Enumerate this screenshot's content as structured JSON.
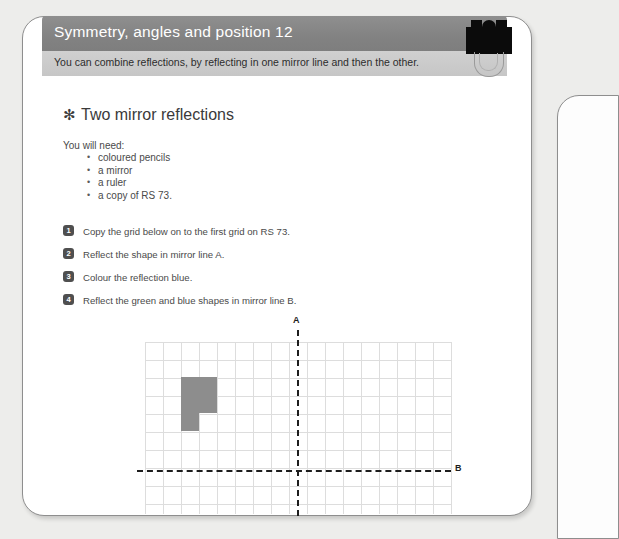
{
  "page": {
    "header": {
      "title": "Symmetry, angles and position 12",
      "subtitle": "You can combine reflections, by reflecting in one mirror line and then the other.",
      "title_bar_color": "#8a8a8a",
      "subtitle_bar_color": "#cacaca",
      "title_text_color": "#ffffff"
    },
    "clip": {
      "name": "binder-clip",
      "color": "#0b0b0b"
    },
    "section": {
      "bullet_glyph": "✻",
      "heading": "Two mirror reflections",
      "materials_label": "You will need:",
      "materials": [
        "coloured pencils",
        "a mirror",
        "a ruler",
        "a copy of RS 73."
      ]
    },
    "steps": [
      {
        "number": "1",
        "text": "Copy the grid below on to the first grid on RS 73."
      },
      {
        "number": "2",
        "text": "Reflect the shape in mirror line A."
      },
      {
        "number": "3",
        "text": "Colour the reflection blue."
      },
      {
        "number": "4",
        "text": "Reflect the green and blue shapes in mirror line B."
      }
    ],
    "diagram": {
      "name": "symmetry-grid",
      "mirror_line_a_label": "A",
      "mirror_line_b_label": "B",
      "grid_columns": 17,
      "grid_rows": 9,
      "cell_size_px": 18,
      "grid_line_color": "#dddddd",
      "shape_color": "#8d8d8d",
      "mirror_line_color": "#1d1d1d",
      "shape_cells": [
        [
          2,
          2
        ],
        [
          3,
          2
        ],
        [
          2,
          3
        ],
        [
          3,
          3
        ],
        [
          2,
          4
        ]
      ]
    }
  }
}
